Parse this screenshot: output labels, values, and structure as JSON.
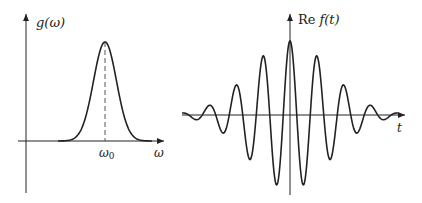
{
  "left_panel": {
    "y_label": "g(ω)",
    "x_label": "ω",
    "center_label": "ω0",
    "center_label_base": "ω",
    "center_label_sub": "0"
  },
  "right_panel": {
    "y_label_prefix": "Re",
    "y_label_func": "f(t)",
    "x_label": "t"
  },
  "colors": {
    "stroke": "#222222",
    "dashed": "#444444"
  }
}
